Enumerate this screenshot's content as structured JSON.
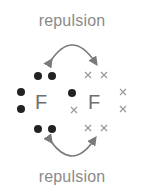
{
  "diagram": {
    "title_top": "repulsion",
    "title_bottom": "repulsion",
    "atoms": [
      {
        "symbol": "F",
        "electron_marker": "dot"
      },
      {
        "symbol": "F",
        "electron_marker": "cross"
      }
    ],
    "colors": {
      "text": "#8a8a8a",
      "atom": "#6e6e6e",
      "dot": "#222222",
      "cross": "#9a9a9a",
      "arrow": "#7a7a7a"
    }
  }
}
